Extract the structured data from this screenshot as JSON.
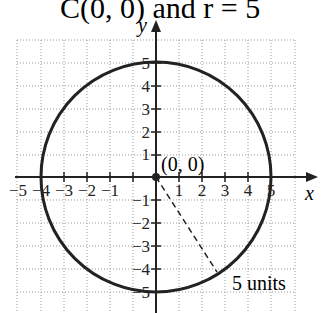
{
  "title": "C(0, 0) and r = 5",
  "axes": {
    "x_label": "x",
    "y_label": "y"
  },
  "x_ticks": [
    "−5",
    "−4",
    "−3",
    "−2",
    "−1",
    "1",
    "2",
    "3",
    "4",
    "5"
  ],
  "y_ticks_pos": [
    "1",
    "2",
    "3",
    "4",
    "5"
  ],
  "y_ticks_neg": [
    "−1",
    "−2",
    "−3",
    "−4",
    "−5"
  ],
  "center_label": "(0, 0)",
  "radius_label": "5 units",
  "circle": {
    "center": [
      0,
      0
    ],
    "radius": 5
  }
}
